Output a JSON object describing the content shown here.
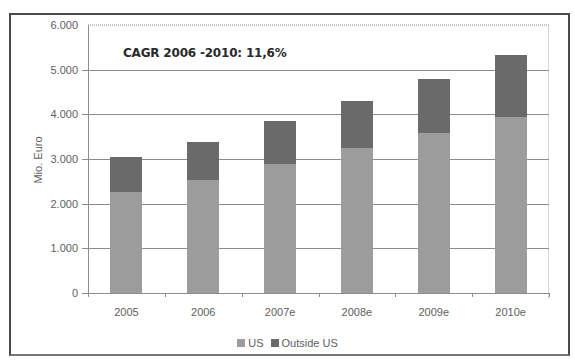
{
  "chart_data": {
    "type": "bar",
    "stacked": true,
    "title": "",
    "annotation": "CAGR 2006 -2010: 11,6%",
    "xlabel": "",
    "ylabel": "Mio. Euro",
    "ylim": [
      0,
      6000
    ],
    "yticks": [
      0,
      1000,
      2000,
      3000,
      4000,
      5000,
      6000
    ],
    "ytick_labels": [
      "0",
      "1.000",
      "2.000",
      "3.000",
      "4.000",
      "5.000",
      "6.000"
    ],
    "categories": [
      "2005",
      "2006",
      "2007e",
      "2008e",
      "2009e",
      "2010e"
    ],
    "series": [
      {
        "name": "US",
        "color": "#9c9c9c",
        "values": [
          2270,
          2530,
          2890,
          3250,
          3590,
          3950
        ]
      },
      {
        "name": "Outside US",
        "color": "#6a6a6a",
        "values": [
          780,
          860,
          970,
          1050,
          1190,
          1380
        ]
      }
    ],
    "totals": [
      3050,
      3390,
      3860,
      4300,
      4780,
      5330
    ],
    "grid": true,
    "legend_position": "bottom"
  },
  "legend": {
    "us_label": "US",
    "outside_label": "Outside US"
  }
}
